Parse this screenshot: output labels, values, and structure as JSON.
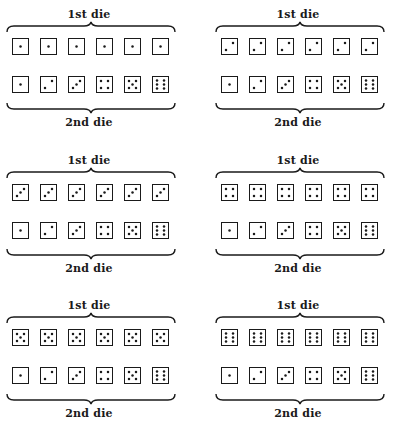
{
  "labels": {
    "first_die": "1st die",
    "second_die": "2nd die"
  },
  "colors": {
    "ink": "#1a1a1a",
    "background": "#ffffff"
  },
  "panels": [
    {
      "first_die_face": 1,
      "first_die_label": "1st die",
      "second_die_label": "2nd die",
      "second_die_faces": [
        1,
        2,
        3,
        4,
        5,
        6
      ]
    },
    {
      "first_die_face": 2,
      "first_die_label": "1st die",
      "second_die_label": "2nd die",
      "second_die_faces": [
        1,
        2,
        3,
        4,
        5,
        6
      ]
    },
    {
      "first_die_face": 3,
      "first_die_label": "1st die",
      "second_die_label": "2nd die",
      "second_die_faces": [
        1,
        2,
        3,
        4,
        5,
        6
      ]
    },
    {
      "first_die_face": 4,
      "first_die_label": "1st die",
      "second_die_label": "2nd die",
      "second_die_faces": [
        1,
        2,
        3,
        4,
        5,
        6
      ]
    },
    {
      "first_die_face": 5,
      "first_die_label": "1st die",
      "second_die_label": "2nd die",
      "second_die_faces": [
        1,
        2,
        3,
        4,
        5,
        6
      ]
    },
    {
      "first_die_face": 6,
      "first_die_label": "1st die",
      "second_die_label": "2nd die",
      "second_die_faces": [
        1,
        2,
        3,
        4,
        5,
        6
      ]
    }
  ]
}
